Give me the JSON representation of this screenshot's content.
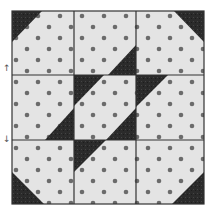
{
  "diagram": {
    "type": "quilt-block",
    "grid": {
      "rows": 3,
      "cols": 3
    },
    "bounds": {
      "x0": 12,
      "y0": 11,
      "x1": 204,
      "y1": 204
    },
    "grid_lines": {
      "x": [
        74,
        136
      ],
      "y": [
        75,
        140
      ]
    },
    "colors": {
      "background": "#ffffff",
      "light_fabric": "#e4e4e4",
      "dot": "#6b6b6b",
      "dark_fabric": "#2b2b2b",
      "seam": "#333333"
    },
    "dot_pattern": {
      "spacing": 11,
      "radius": 2.2
    },
    "dark_triangles": [
      {
        "name": "corner-top-left",
        "points": "12,11 42,11 12,42"
      },
      {
        "name": "corner-top-right",
        "points": "174,11 204,11 204,42"
      },
      {
        "name": "corner-bottom-left",
        "points": "12,172 12,204 44,204"
      },
      {
        "name": "corner-bottom-right",
        "points": "204,172 204,204 172,204"
      },
      {
        "name": "top-middle",
        "points": "136,45 136,75 108,75"
      },
      {
        "name": "center-top-left",
        "points": "74,75 104,75 74,106"
      },
      {
        "name": "center-bottom-right",
        "points": "136,108 136,140 106,140"
      },
      {
        "name": "middle-left",
        "points": "74,108 74,140 45,140"
      },
      {
        "name": "middle-right",
        "points": "136,75 168,75 136,107"
      },
      {
        "name": "bottom-middle",
        "points": "74,140 106,140 74,172"
      }
    ],
    "side_arrows": [
      {
        "glyph": "↑",
        "y": 64
      },
      {
        "glyph": "↓",
        "y": 135
      }
    ]
  }
}
